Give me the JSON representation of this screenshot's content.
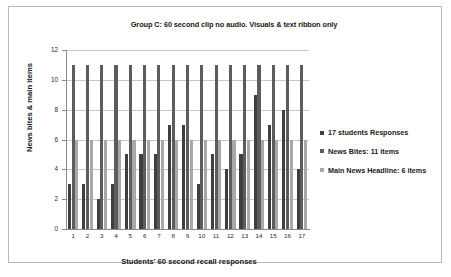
{
  "chart_data": {
    "type": "bar",
    "title": "Group C: 60 second clip no audio. Visuals & text ribbon only",
    "xlabel": "Students' 60 second recall responses",
    "ylabel": "News bites & main items",
    "categories": [
      "1",
      "2",
      "3",
      "4",
      "5",
      "6",
      "7",
      "8",
      "9",
      "10",
      "11",
      "12",
      "13",
      "14",
      "15",
      "16",
      "17"
    ],
    "yticks": [
      0,
      2,
      4,
      6,
      8,
      10,
      12
    ],
    "ylim": [
      0,
      12
    ],
    "grid": true,
    "legend_position": "right",
    "series": [
      {
        "name": "17 students Responses",
        "color": "#3f3f3f",
        "values": [
          3,
          3,
          2,
          3,
          5,
          5,
          5,
          7,
          7,
          3,
          5,
          4,
          5,
          9,
          7,
          8,
          4
        ]
      },
      {
        "name": "News Bites: 11 items",
        "color": "#5c5c5c",
        "values": [
          11,
          11,
          11,
          11,
          11,
          11,
          11,
          11,
          11,
          11,
          11,
          11,
          11,
          11,
          11,
          11,
          11
        ]
      },
      {
        "name": "Main News Headline: 6 items",
        "color": "#a8a8a8",
        "values": [
          6,
          6,
          6,
          6,
          6,
          6,
          6,
          6,
          6,
          6,
          6,
          6,
          6,
          6,
          6,
          6,
          6
        ]
      }
    ]
  }
}
